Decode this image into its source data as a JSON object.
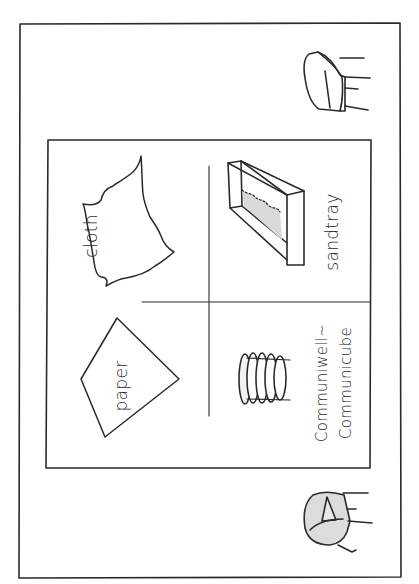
{
  "diagram": {
    "type": "floor-plan-sketch",
    "style": "hand-drawn pen on white, rotated 90° (labels read bottom-to-top)",
    "colors": {
      "ink": "#2a2a2a",
      "background": "#ffffff",
      "shade": "#d9d9d9"
    },
    "outer_room": {
      "label": ""
    },
    "inner_area": {
      "quadrants": [
        {
          "id": "cloth",
          "label": "cloth",
          "shape": "irregular torn triangle"
        },
        {
          "id": "sandtray",
          "label": "sandtray",
          "shape": "3D rectangular tray with shaded sand"
        },
        {
          "id": "paper",
          "label": "paper",
          "shape": "kite / quadrilateral"
        },
        {
          "id": "communicube",
          "label_line1": "Communiwell~",
          "label_line2": "Communicube",
          "shape": "stack of discs / rolled cylinders"
        }
      ]
    },
    "furniture": [
      {
        "id": "armchair-top",
        "label": "",
        "shading": "none"
      },
      {
        "id": "armchair-bottom",
        "label": "",
        "shading": "grey"
      }
    ]
  }
}
